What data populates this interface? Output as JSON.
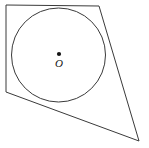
{
  "figure": {
    "background_color": "#ffffff",
    "stroke_color": "#3a3a3a",
    "label_color": "#141414",
    "width": 149,
    "height": 148
  },
  "labels": {
    "center_point": "O"
  },
  "chart_data": {
    "type": "diagram",
    "shapes": [
      {
        "name": "quadrilateral",
        "kind": "polygon",
        "closed": true,
        "stroke": "#3a3a3a",
        "fill": "none",
        "points": [
          {
            "label": "top-left",
            "x": 6,
            "y": 5
          },
          {
            "label": "top-right",
            "x": 99,
            "y": 6
          },
          {
            "label": "bottom-right",
            "x": 139,
            "y": 141
          },
          {
            "label": "left-lower",
            "x": 6,
            "y": 92
          }
        ]
      },
      {
        "name": "inscribed-circle",
        "kind": "circle",
        "stroke": "#3a3a3a",
        "fill": "none",
        "cx": 58.5,
        "cy": 55,
        "r": 47
      },
      {
        "name": "center-point",
        "kind": "point",
        "fill": "#141414",
        "cx": 59,
        "cy": 54,
        "r": 2.1,
        "label": "O",
        "label_x": 59,
        "label_y": 67
      }
    ],
    "xlim": [
      0,
      149
    ],
    "ylim": [
      0,
      148
    ],
    "grid": false,
    "legend": false
  }
}
